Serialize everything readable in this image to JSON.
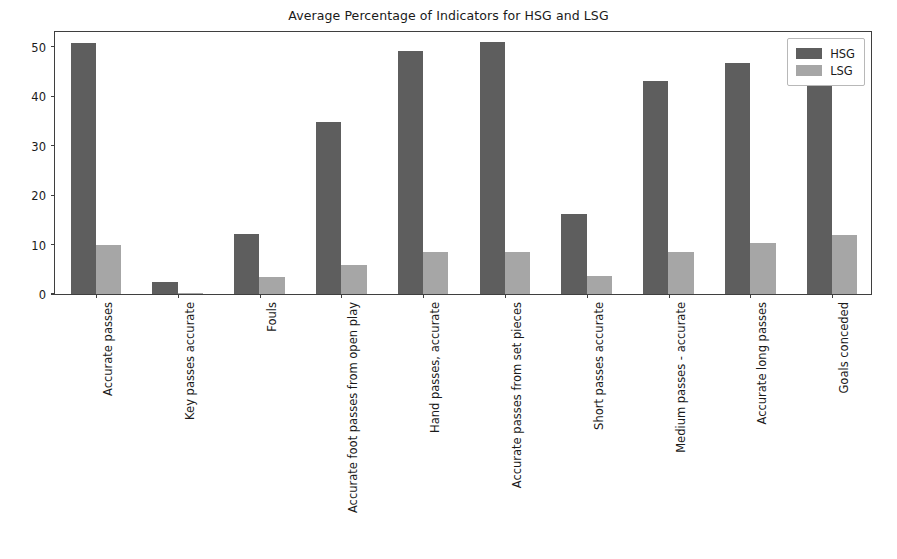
{
  "chart_data": {
    "type": "bar",
    "title": "Average Percentage of Indicators for HSG and LSG",
    "xlabel": "",
    "ylabel": "",
    "ylim": [
      0,
      53
    ],
    "yticks": [
      0,
      10,
      20,
      30,
      40,
      50
    ],
    "grid": false,
    "legend_position": "upper right",
    "categories": [
      "Accurate passes",
      "Key passes accurate",
      "Fouls",
      "Accurate foot passes from open play",
      "Hand passes, accurate",
      "Accurate passes from set pieces",
      "Short passes accurate",
      "Medium passes - accurate",
      "Accurate long passes",
      "Goals conceded"
    ],
    "series": [
      {
        "name": "HSG",
        "color": "#5e5e5e",
        "values": [
          50.7,
          2.4,
          12.2,
          34.8,
          49.2,
          51.0,
          16.2,
          43.1,
          46.7,
          47.2
        ]
      },
      {
        "name": "LSG",
        "color": "#a6a6a6",
        "values": [
          10.0,
          0.3,
          3.5,
          5.8,
          8.4,
          8.6,
          3.6,
          8.5,
          10.3,
          11.9
        ]
      }
    ]
  },
  "legend": {
    "entries": [
      {
        "label": "HSG"
      },
      {
        "label": "LSG"
      }
    ]
  }
}
